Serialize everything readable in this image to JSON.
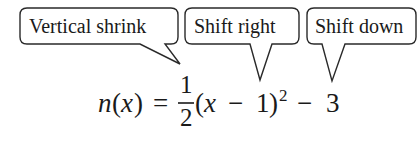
{
  "callouts": [
    {
      "id": "vertical-shrink",
      "label": "Vertical shrink"
    },
    {
      "id": "shift-right",
      "label": "Shift right"
    },
    {
      "id": "shift-down",
      "label": "Shift down"
    }
  ],
  "formula": {
    "function_name": "n",
    "variable": "x",
    "open_paren": "(",
    "close_paren": ")",
    "equals": "=",
    "fraction_numerator": "1",
    "fraction_denominator": "2",
    "inner_minus": "−",
    "inner_constant": "1",
    "exponent": "2",
    "outer_minus": "−",
    "outer_constant": "3",
    "full_text": "n(x) = 1/2 (x − 1)^2 − 3"
  },
  "colors": {
    "stroke": "#2a2a2a",
    "text": "#1a1a1a",
    "background": "#ffffff"
  }
}
